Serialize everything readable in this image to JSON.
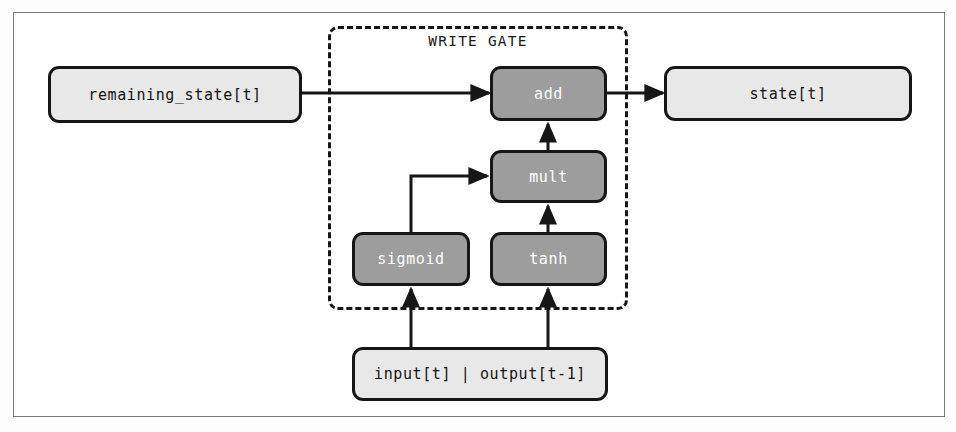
{
  "diagram": {
    "title": "WRITE GATE",
    "gate_label": "WRITE GATE",
    "nodes": {
      "remaining_state": {
        "label": "remaining_state[t]",
        "style": "light"
      },
      "add": {
        "label": "add",
        "style": "dark"
      },
      "state": {
        "label": "state[t]",
        "style": "light"
      },
      "mult": {
        "label": "mult",
        "style": "dark"
      },
      "sigmoid": {
        "label": "sigmoid",
        "style": "dark"
      },
      "tanh": {
        "label": "tanh",
        "style": "dark"
      },
      "input": {
        "label": "input[t] | output[t-1]",
        "style": "light"
      }
    },
    "edges": [
      {
        "from": "remaining_state",
        "to": "add",
        "kind": "straight-right"
      },
      {
        "from": "add",
        "to": "state",
        "kind": "straight-right"
      },
      {
        "from": "mult",
        "to": "add",
        "kind": "straight-up"
      },
      {
        "from": "tanh",
        "to": "mult",
        "kind": "straight-up"
      },
      {
        "from": "sigmoid",
        "to": "mult",
        "kind": "elbow-up-right"
      },
      {
        "from": "input",
        "to": "sigmoid",
        "kind": "straight-up"
      },
      {
        "from": "input",
        "to": "tanh",
        "kind": "straight-up"
      }
    ],
    "colors": {
      "node_dark_fill": "#9d9d9d",
      "node_light_fill": "#e8e8e8",
      "stroke": "#161616",
      "frame": "#7a7a7a",
      "dark_text": "#ffffff",
      "light_text": "#141414",
      "background": "#ffffff"
    }
  }
}
